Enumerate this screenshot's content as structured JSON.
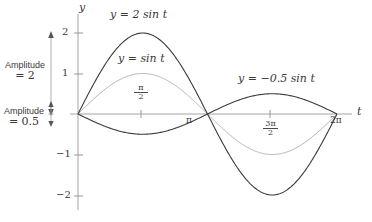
{
  "figure": {
    "background": "#ffffff",
    "axis_color": "#9a9a9a",
    "curve_dark": "#3c3c3c",
    "curve_light": "#b4b4b4",
    "text_color": "#3a3a3a"
  },
  "axes": {
    "x_axis_name": "t",
    "y_axis_name": "y",
    "x_ticks": [
      {
        "label": "π",
        "t": 3.14159
      },
      {
        "label_num": "3π",
        "label_den": "2",
        "t": 4.71239
      },
      {
        "label": "2π",
        "t": 6.28319
      },
      {
        "label_num": "π",
        "label_den": "2",
        "t": 1.5708
      }
    ],
    "y_ticks": [
      {
        "label": "2",
        "value": 2
      },
      {
        "label": "1",
        "value": 1
      },
      {
        "label": "−1",
        "value": -1
      },
      {
        "label": "−2",
        "value": -2
      }
    ]
  },
  "curve_labels": [
    {
      "id": "two-sin-t",
      "text": "y = 2 sin t"
    },
    {
      "id": "sin-t",
      "text": "y = sin t"
    },
    {
      "id": "neg-half-sin-t",
      "text": "y = −0.5 sin t"
    }
  ],
  "annotations": [
    {
      "id": "amplitude-2",
      "line1": "Amplitude",
      "line2": "= 2"
    },
    {
      "id": "amplitude-0-5",
      "line1": "Amplitude",
      "line2": "= 0.5"
    }
  ],
  "chart_data": {
    "type": "line",
    "title": "",
    "xlabel": "t",
    "ylabel": "y",
    "xlim": [
      -0.15,
      6.75
    ],
    "ylim": [
      -2.45,
      2.45
    ],
    "grid": false,
    "legend": "inline-curve-labels",
    "x_tick_values": [
      1.5708,
      3.14159,
      4.71239,
      6.28319
    ],
    "x_tick_labels": [
      "π/2",
      "π",
      "3π/2",
      "2π"
    ],
    "y_tick_values": [
      2,
      1,
      -1,
      -2
    ],
    "y_tick_labels": [
      "2",
      "1",
      "−1",
      "−2"
    ],
    "series": [
      {
        "name": "y = 2 sin t",
        "amplitude": 2,
        "formula": "2*sin(t)",
        "color": "#3c3c3c",
        "x": [
          0,
          0.7854,
          1.5708,
          2.3562,
          3.14159,
          3.92699,
          4.71239,
          5.49779,
          6.28319
        ],
        "values": [
          0,
          1.414,
          2,
          1.414,
          0,
          -1.414,
          -2,
          -1.414,
          0
        ]
      },
      {
        "name": "y = sin t",
        "amplitude": 1,
        "formula": "sin(t)",
        "color": "#b4b4b4",
        "x": [
          0,
          0.7854,
          1.5708,
          2.3562,
          3.14159,
          3.92699,
          4.71239,
          5.49779,
          6.28319
        ],
        "values": [
          0,
          0.707,
          1,
          0.707,
          0,
          -0.707,
          -1,
          -0.707,
          0
        ]
      },
      {
        "name": "y = −0.5 sin t",
        "amplitude": 0.5,
        "formula": "-0.5*sin(t)",
        "color": "#3c3c3c",
        "x": [
          0,
          0.7854,
          1.5708,
          2.3562,
          3.14159,
          3.92699,
          4.71239,
          5.49779,
          6.28319
        ],
        "values": [
          0,
          -0.354,
          -0.5,
          -0.354,
          0,
          0.354,
          0.5,
          0.354,
          0
        ]
      }
    ],
    "annotations": [
      {
        "text": "Amplitude = 2",
        "refers_to": "y = 2 sin t",
        "span_y": [
          0,
          2
        ]
      },
      {
        "text": "Amplitude = 0.5",
        "refers_to": "y = −0.5 sin t",
        "span_y": [
          -0.5,
          0.5
        ]
      }
    ]
  }
}
